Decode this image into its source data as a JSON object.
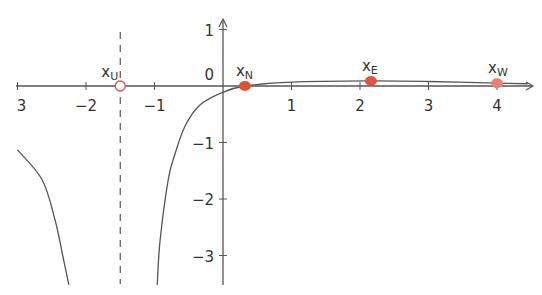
{
  "header": {
    "text": ""
  },
  "chart_data": {
    "type": "line",
    "title": "",
    "xlabel": "",
    "ylabel": "",
    "xlim": [
      -3,
      4.5
    ],
    "ylim": [
      -3.5,
      1.2
    ],
    "grid": false,
    "x_ticks": [
      {
        "value": -3,
        "label": "3"
      },
      {
        "value": -2,
        "label": "−2"
      },
      {
        "value": -1,
        "label": "−1"
      },
      {
        "value": 1,
        "label": "1"
      },
      {
        "value": 2,
        "label": "2"
      },
      {
        "value": 3,
        "label": "3"
      },
      {
        "value": 4,
        "label": "4"
      }
    ],
    "y_ticks": [
      {
        "value": 1,
        "label": "1"
      },
      {
        "value": -1,
        "label": "−1"
      },
      {
        "value": -2,
        "label": "−2"
      },
      {
        "value": -3,
        "label": "−3"
      }
    ],
    "origin_label": "0",
    "asymptote": {
      "type": "vertical",
      "x": -1.5,
      "style": "dashed"
    },
    "series": [
      {
        "name": "left-branch",
        "points": [
          [
            -3.0,
            -1.13
          ],
          [
            -2.64,
            -1.66
          ],
          [
            -2.45,
            -2.38
          ],
          [
            -2.34,
            -3.0
          ],
          [
            -2.25,
            -3.52
          ]
        ]
      },
      {
        "name": "right-branch",
        "points": [
          [
            -0.96,
            -3.52
          ],
          [
            -0.92,
            -2.75
          ],
          [
            -0.8,
            -1.66
          ],
          [
            -0.7,
            -1.2
          ],
          [
            -0.55,
            -0.7
          ],
          [
            -0.34,
            -0.34
          ],
          [
            0.0,
            -0.11
          ],
          [
            0.32,
            0.0
          ],
          [
            1.0,
            0.07
          ],
          [
            2.16,
            0.09
          ],
          [
            3.0,
            0.08
          ],
          [
            4.0,
            0.05
          ],
          [
            4.45,
            0.04
          ]
        ]
      }
    ],
    "points": [
      {
        "id": "xU",
        "label": "x",
        "sub": "U",
        "x": -1.5,
        "y": 0,
        "style": "open",
        "color": "#d9534f"
      },
      {
        "id": "xN",
        "label": "x",
        "sub": "N",
        "x": 0.32,
        "y": 0,
        "style": "filled",
        "color": "#e0532f"
      },
      {
        "id": "xE",
        "label": "x",
        "sub": "E",
        "x": 2.16,
        "y": 0.09,
        "style": "filled",
        "color": "#e0583a"
      },
      {
        "id": "xW",
        "label": "x",
        "sub": "W",
        "x": 4.0,
        "y": 0.05,
        "style": "filled",
        "color": "#e8806e"
      }
    ]
  },
  "colors": {
    "axis": "#555555",
    "curve": "#555555",
    "point": "#e0583a"
  }
}
